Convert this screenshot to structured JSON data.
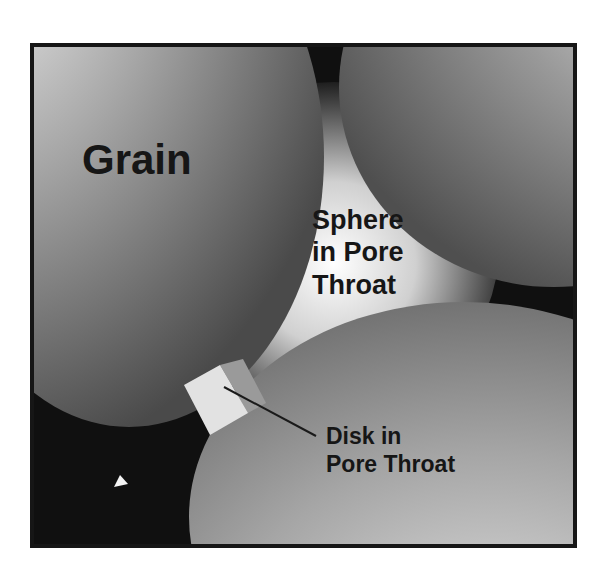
{
  "diagram": {
    "labels": {
      "grain": "Grain",
      "sphere": [
        "Sphere",
        "in Pore",
        "Throat"
      ],
      "disk": [
        "Disk in",
        "Pore Throat"
      ]
    },
    "elements": [
      {
        "name": "grain-left",
        "shape": "ellipse",
        "shade": "gray gradient"
      },
      {
        "name": "grain-top-right",
        "shape": "ellipse",
        "shade": "gray gradient"
      },
      {
        "name": "grain-bottom",
        "shape": "ellipse",
        "shade": "gray gradient"
      },
      {
        "name": "sphere-in-pore-throat",
        "shape": "glowing sphere",
        "shade": "light radial"
      },
      {
        "name": "disk-in-pore-throat",
        "shape": "disk (side view)",
        "shade": "light gray"
      },
      {
        "name": "small-particle",
        "shape": "triangle",
        "shade": "white"
      }
    ],
    "colors": {
      "background": "#101010",
      "frame": "#161616",
      "text": "#161616",
      "disk_face": "#e2e2e2",
      "disk_edge": "#9a9a9a",
      "leader_line": "#1a1a1a"
    }
  }
}
